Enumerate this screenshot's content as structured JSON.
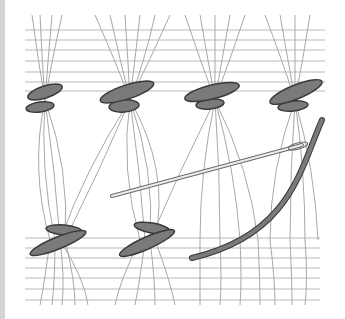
{
  "illustration": {
    "subject": "hemstitch embroidery diagram",
    "colors": {
      "background": "#ffffff",
      "edge_strip": "#d4d4d4",
      "fabric_thread": "#b8b8b8",
      "stitch_fill": "#7a7a7a",
      "stitch_outline": "#3a3a3a",
      "needle": "#e6e6e6"
    },
    "top_bundles_x": [
      45,
      130,
      215,
      295
    ],
    "bottom_bundles_x": [
      55,
      145
    ]
  }
}
